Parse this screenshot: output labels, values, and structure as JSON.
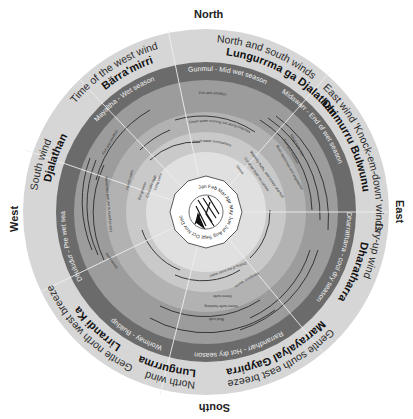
{
  "compass": {
    "north": "North",
    "east": "East",
    "south": "South",
    "west": "West"
  },
  "winds": [
    {
      "desc": "North and south winds",
      "name": "Lungurrma ga Djalathan",
      "start": 0,
      "end": 55
    },
    {
      "desc": "East wind 'Knock-em-down' winds",
      "name": "Dhimurru Bulwunu",
      "start": 55,
      "end": 120
    },
    {
      "desc": "Dry-up wind",
      "name": "Dharatharra",
      "start": 120,
      "end": 150
    },
    {
      "desc": "Gentle south east breeze",
      "name": "Marrayalyal Gaypirra",
      "start": 150,
      "end": 190
    },
    {
      "desc": "North wind",
      "name": "Lungurrma",
      "start": 190,
      "end": 220
    },
    {
      "desc": "Gentle north west breeze",
      "name": "Lirrandi Ka",
      "start": 220,
      "end": 250
    },
    {
      "desc": "South wind",
      "name": "Djalathan",
      "start": 250,
      "end": 300
    },
    {
      "desc": "Time of the west wind",
      "name": "Bärra'mirri",
      "start": 300,
      "end": 360
    }
  ],
  "seasons": [
    {
      "label": "Gunmul - Mid wet season",
      "start": 345,
      "end": 45
    },
    {
      "label": "Midawarr - End of wet season",
      "start": 45,
      "end": 90
    },
    {
      "label": "Dharratharra - cool dry season",
      "start": 90,
      "end": 150
    },
    {
      "label": "Rarrandharr - Hot dry season",
      "start": 150,
      "end": 210
    },
    {
      "label": "Worlmay - Buildup",
      "start": 210,
      "end": 250
    },
    {
      "label": "Dhuludur - Pre wet season",
      "start": 250,
      "end": 300
    },
    {
      "label": "Mayaltha - Wet season",
      "start": 300,
      "end": 345
    }
  ],
  "rings": {
    "outer_note": "Fish and shellfish",
    "mid_note": "Fresh water running out along beaches",
    "inner_note": "Fresh water everywhere",
    "east_notes": [
      "Small fruits ripe",
      "Fish and shellfish",
      "Bush medicines and vegetables"
    ],
    "south_notes": [
      "Green turtle",
      "Green turtle hatching",
      "Mud crab",
      "Drying of the inner water",
      "Mangrove worms"
    ],
    "west_notes": [
      "Green turtle",
      "Lots of plants to eat and wild honey",
      "Hermit crabs",
      "Fish and shellfish"
    ],
    "northwest_notes": [
      "Eat goanna",
      "Crocodile eggs",
      "Long yams"
    ],
    "northeast_notes": [
      "Waterlily bulbs, wild honey and fruit",
      "Cut down bark for canoes",
      "Geese"
    ]
  },
  "months": [
    "Jan",
    "Feb",
    "Mar",
    "Apr",
    "May",
    "Jun",
    "Jul",
    "Aug",
    "Sept",
    "Oct",
    "Nov",
    "Dec"
  ],
  "colors": {
    "wind_ring": "#d6d6d6",
    "season_ring": "#6b6b6b",
    "ring_a": "#9c9c9c",
    "ring_b": "#b2b2b2",
    "ring_c": "#c9c9c9",
    "center": "#e0e0e0"
  }
}
